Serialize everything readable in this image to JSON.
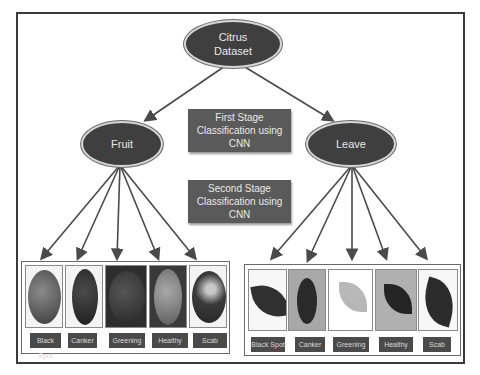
{
  "diagram": {
    "root": {
      "label_line1": "Citrus",
      "label_line2": "Dataset"
    },
    "stage1": {
      "line1": "First Stage",
      "line2": "Classification using",
      "line3": "CNN"
    },
    "stage2": {
      "line1": "Second  Stage",
      "line2": "Classification using",
      "line3": "CNN"
    },
    "branches": [
      {
        "label": "Fruit",
        "classes": [
          "Black Spot",
          "Canker",
          "Greening",
          "Healthy",
          "Scab"
        ]
      },
      {
        "label": "Leave",
        "classes": [
          "Black Spot",
          "Canker",
          "Greening",
          "Healthy",
          "Scab"
        ]
      }
    ],
    "colors": {
      "node_fill": "#3f3f3f",
      "box_fill": "#5a5a5a",
      "arrow": "#4a4a4a",
      "frame": "#3a3a3a"
    }
  }
}
